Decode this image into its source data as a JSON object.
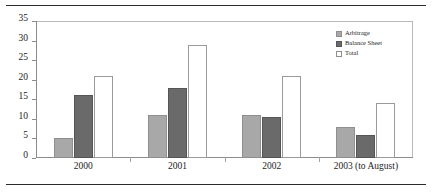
{
  "chart_data": {
    "type": "bar",
    "title": "",
    "subtitle": "",
    "xlabel": "",
    "ylabel": "",
    "categories": [
      "2000",
      "2001",
      "2002",
      "2003 (to August)"
    ],
    "series": [
      {
        "name": "Arbitrage",
        "values": [
          5,
          11,
          11,
          8
        ],
        "color": "#a8a8a8"
      },
      {
        "name": "Balance Sheet",
        "values": [
          16,
          18,
          10.5,
          6
        ],
        "color": "#6a6a6a"
      },
      {
        "name": "Total",
        "values": [
          21,
          29,
          21,
          14
        ],
        "color": "#ffffff"
      }
    ],
    "ylim": [
      0,
      35
    ],
    "yticks": [
      0,
      5,
      10,
      15,
      20,
      25,
      30,
      35
    ],
    "ytick_labels": [
      "0",
      "5",
      "10",
      "15",
      "20",
      "25",
      "30",
      "35"
    ],
    "grid": false,
    "legend_position": "top-right",
    "legend_entries": [
      "Arbitrage",
      "Balance Sheet",
      "Total"
    ]
  },
  "colors": {
    "arbitrage": "#a8a8a8",
    "balance_sheet": "#6a6a6a",
    "total": "#ffffff",
    "frame": "#b9b9b9",
    "axis": "#8c8c8c",
    "rule": "#2b2b2b",
    "text": "#1c1c1c"
  }
}
